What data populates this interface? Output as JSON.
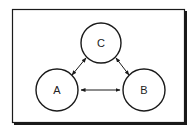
{
  "diagram": {
    "nodes": [
      {
        "id": "A",
        "label": "A",
        "cx": 57,
        "cy": 90,
        "r": 21
      },
      {
        "id": "B",
        "label": "B",
        "cx": 144,
        "cy": 90,
        "r": 21
      },
      {
        "id": "C",
        "label": "C",
        "cx": 101,
        "cy": 43,
        "r": 20
      }
    ],
    "edges": [
      {
        "from": "A",
        "to": "B",
        "direction": "bidirectional"
      },
      {
        "from": "A",
        "to": "C",
        "direction": "bidirectional"
      },
      {
        "from": "B",
        "to": "C",
        "direction": "bidirectional"
      }
    ],
    "colors": {
      "stroke": "#1a1a1a",
      "background": "#ffffff"
    }
  }
}
